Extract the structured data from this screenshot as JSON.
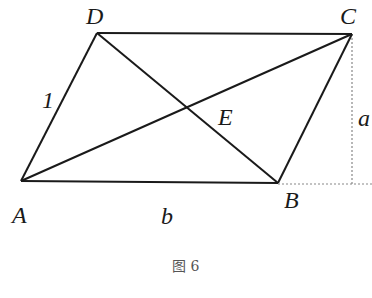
{
  "figure": {
    "caption": "图 6",
    "points": {
      "A": {
        "label": "A",
        "x": 21,
        "y": 181
      },
      "B": {
        "label": "B",
        "x": 278,
        "y": 183
      },
      "C": {
        "label": "C",
        "x": 352,
        "y": 34
      },
      "D": {
        "label": "D",
        "x": 97,
        "y": 33
      },
      "E": {
        "label": "E",
        "x": 187,
        "y": 108
      }
    },
    "side_labels": {
      "AD": "1",
      "AB": "b",
      "height": "a"
    },
    "colors": {
      "line": "#1a1a1a",
      "dashed": "#888888"
    }
  }
}
